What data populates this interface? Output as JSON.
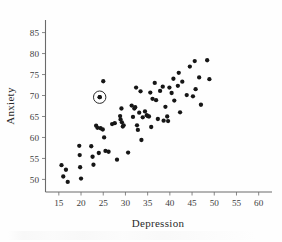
{
  "figure": {
    "background_color": "#fefefe",
    "point_color": "#161616",
    "axis_color": "#6a6a6a"
  },
  "axes": {
    "x_title": "Depression",
    "y_title": "Anxiety"
  },
  "chart_data": {
    "type": "scatter",
    "title": "",
    "xlabel": "Depression",
    "ylabel": "Anxiety",
    "xlim": [
      12,
      63
    ],
    "ylim": [
      47,
      88
    ],
    "xticks": [
      15,
      20,
      25,
      30,
      35,
      40,
      45,
      50,
      55,
      60
    ],
    "yticks": [
      50,
      55,
      60,
      65,
      70,
      75,
      80,
      85
    ],
    "grid": false,
    "legend": null,
    "marker": "filled-circle",
    "annotations": [
      {
        "type": "circled-point",
        "x": 24.2,
        "y": 69.6,
        "note": "outlier marked with open circle"
      }
    ],
    "points": [
      [
        15.6,
        53.4
      ],
      [
        16.0,
        50.7
      ],
      [
        16.6,
        52.3
      ],
      [
        17.0,
        49.4
      ],
      [
        19.6,
        58.0
      ],
      [
        19.7,
        55.8
      ],
      [
        19.8,
        52.9
      ],
      [
        20.0,
        50.2
      ],
      [
        22.3,
        57.9
      ],
      [
        22.6,
        55.4
      ],
      [
        22.8,
        53.5
      ],
      [
        23.4,
        62.8
      ],
      [
        23.7,
        62.3
      ],
      [
        24.0,
        56.3
      ],
      [
        24.2,
        69.6
      ],
      [
        24.4,
        62.2
      ],
      [
        24.9,
        61.9
      ],
      [
        25.0,
        73.4
      ],
      [
        25.2,
        60.0
      ],
      [
        25.5,
        56.8
      ],
      [
        26.2,
        56.6
      ],
      [
        27.0,
        63.2
      ],
      [
        27.6,
        63.4
      ],
      [
        28.1,
        54.7
      ],
      [
        28.8,
        65.1
      ],
      [
        28.9,
        64.3
      ],
      [
        29.1,
        66.9
      ],
      [
        29.2,
        63.6
      ],
      [
        29.4,
        62.6
      ],
      [
        29.6,
        62.9
      ],
      [
        30.6,
        56.4
      ],
      [
        31.4,
        67.6
      ],
      [
        31.7,
        64.9
      ],
      [
        32.0,
        66.9
      ],
      [
        32.2,
        67.2
      ],
      [
        32.4,
        71.9
      ],
      [
        32.6,
        62.9
      ],
      [
        32.8,
        61.8
      ],
      [
        33.1,
        65.9
      ],
      [
        33.4,
        71.0
      ],
      [
        33.6,
        59.4
      ],
      [
        33.9,
        64.8
      ],
      [
        34.4,
        66.2
      ],
      [
        34.8,
        65.3
      ],
      [
        35.0,
        65.1
      ],
      [
        35.3,
        65.0
      ],
      [
        35.6,
        70.7
      ],
      [
        35.8,
        62.5
      ],
      [
        36.1,
        69.2
      ],
      [
        36.6,
        73.0
      ],
      [
        36.9,
        68.9
      ],
      [
        37.3,
        64.4
      ],
      [
        37.8,
        71.1
      ],
      [
        38.4,
        72.1
      ],
      [
        38.6,
        64.0
      ],
      [
        39.0,
        67.3
      ],
      [
        39.4,
        65.0
      ],
      [
        39.6,
        63.9
      ],
      [
        39.9,
        71.9
      ],
      [
        40.4,
        70.6
      ],
      [
        40.8,
        74.0
      ],
      [
        41.0,
        68.8
      ],
      [
        41.8,
        72.3
      ],
      [
        42.0,
        75.4
      ],
      [
        42.3,
        66.0
      ],
      [
        42.8,
        73.3
      ],
      [
        43.8,
        70.1
      ],
      [
        44.5,
        76.9
      ],
      [
        45.2,
        69.8
      ],
      [
        45.6,
        78.2
      ],
      [
        45.8,
        71.5
      ],
      [
        46.6,
        74.3
      ],
      [
        47.0,
        67.8
      ],
      [
        48.4,
        78.4
      ],
      [
        48.9,
        73.9
      ]
    ]
  }
}
